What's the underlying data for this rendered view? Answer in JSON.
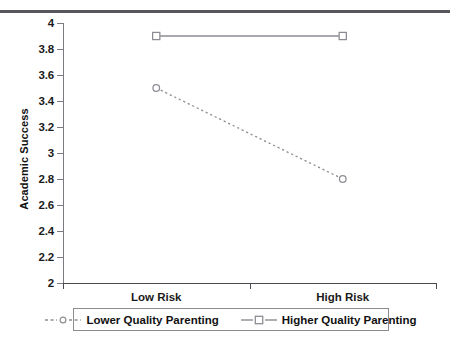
{
  "chart_data": {
    "type": "line",
    "title": "",
    "xlabel": "",
    "ylabel": "Academic Success",
    "categories": [
      "Low Risk",
      "High Risk"
    ],
    "ylim": [
      2,
      4
    ],
    "ytick_labels": [
      "2",
      "2.2",
      "2.4",
      "2.6",
      "2.8",
      "3",
      "3.2",
      "3.4",
      "3.6",
      "3.8",
      "4"
    ],
    "ytick_values": [
      2,
      2.2,
      2.4,
      2.6,
      2.8,
      3,
      3.2,
      3.4,
      3.6,
      3.8,
      4
    ],
    "grid": false,
    "legend_position": "bottom",
    "series": [
      {
        "name": "Lower Quality Parenting",
        "values": [
          3.5,
          2.8
        ],
        "line_style": "dotted",
        "marker": "open-circle",
        "color": "#8c8c92"
      },
      {
        "name": "Higher Quality Parenting",
        "values": [
          3.9,
          3.9
        ],
        "line_style": "solid",
        "marker": "open-square",
        "color": "#8c8c92"
      }
    ]
  },
  "legend": {
    "items": [
      {
        "label": "Lower Quality Parenting"
      },
      {
        "label": "Higher Quality Parenting"
      }
    ]
  },
  "colors": {
    "top_rule": "#56565c",
    "axis": "#4a4a50",
    "series": "#8c8c92",
    "text": "#111111",
    "background": "#ffffff"
  }
}
